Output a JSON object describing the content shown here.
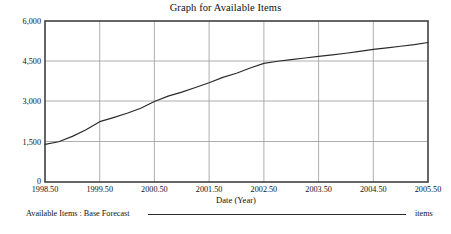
{
  "chart": {
    "title": "Graph for Available Items",
    "xlabel": "Date (Year)",
    "legend_label": "Available Items : Base Forecast",
    "legend_unit": "items",
    "ytick_0": "0",
    "ytick_1": "1,500",
    "ytick_2": "3,000",
    "ytick_3": "4,500",
    "ytick_4": "6,000",
    "xtick_0": "1998.50",
    "xtick_1": "1999.50",
    "xtick_2": "2000.50",
    "xtick_3": "2001.50",
    "xtick_4": "2002.50",
    "xtick_5": "2003.50",
    "xtick_6": "2004.50",
    "xtick_7": "2005.50"
  },
  "chart_data": {
    "type": "line",
    "title": "Graph for Available Items",
    "subtitle": "",
    "xlabel": "Date (Year)",
    "ylabel": "",
    "xlim": [
      1998.5,
      2005.5
    ],
    "ylim": [
      0,
      6000
    ],
    "grid": true,
    "legend_position": "below-plot",
    "xticks": [
      1998.5,
      1999.5,
      2000.5,
      2001.5,
      2002.5,
      2003.5,
      2004.5,
      2005.5
    ],
    "xtick_labels": [
      "1998.50",
      "1999.50",
      "2000.50",
      "2001.50",
      "2002.50",
      "2003.50",
      "2004.50",
      "2005.50"
    ],
    "yticks": [
      0,
      1500,
      3000,
      4500,
      6000
    ],
    "ytick_labels": [
      "0",
      "1,500",
      "3,000",
      "4,500",
      "6,000"
    ],
    "units": "items",
    "series": [
      {
        "name": "Available Items : Base Forecast",
        "color": "#2a2a2a",
        "x": [
          1998.5,
          1998.75,
          1999.0,
          1999.25,
          1999.5,
          1999.75,
          2000.0,
          2000.25,
          2000.5,
          2000.75,
          2001.0,
          2001.25,
          2001.5,
          2001.75,
          2002.0,
          2002.25,
          2002.5,
          2002.75,
          2003.0,
          2003.25,
          2003.5,
          2003.75,
          2004.0,
          2004.25,
          2004.5,
          2004.75,
          2005.0,
          2005.25,
          2005.5
        ],
        "values": [
          1400,
          1500,
          1700,
          1950,
          2250,
          2400,
          2560,
          2750,
          3000,
          3200,
          3350,
          3520,
          3700,
          3900,
          4050,
          4250,
          4420,
          4500,
          4560,
          4620,
          4680,
          4740,
          4800,
          4870,
          4940,
          5000,
          5060,
          5120,
          5200
        ]
      }
    ]
  }
}
